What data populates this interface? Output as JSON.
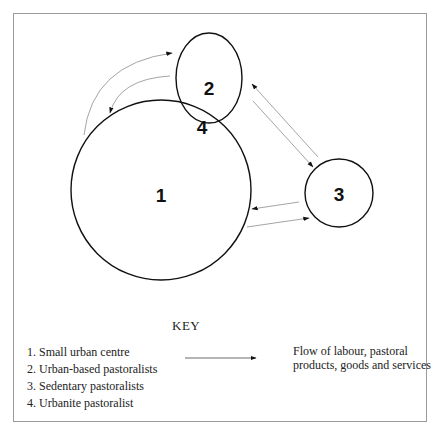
{
  "diagram": {
    "nodes": [
      {
        "id": "1",
        "label": "1",
        "shape": "circle"
      },
      {
        "id": "2",
        "label": "2",
        "shape": "ellipse"
      },
      {
        "id": "3",
        "label": "3",
        "shape": "circle"
      },
      {
        "id": "4",
        "label": "4",
        "shape": "overlap-of-1-and-2"
      }
    ],
    "flows": [
      {
        "from": "1",
        "to": "2",
        "style": "curved"
      },
      {
        "from": "2",
        "to": "1",
        "style": "curved"
      },
      {
        "from": "3",
        "to": "2",
        "style": "straight"
      },
      {
        "from": "2",
        "to": "3",
        "style": "straight"
      },
      {
        "from": "3",
        "to": "1",
        "style": "straight"
      },
      {
        "from": "1",
        "to": "3",
        "style": "straight"
      }
    ]
  },
  "key": {
    "title": "KEY",
    "items": [
      "1. Small urban centre",
      "2. Urban-based pastoralists",
      "3. Sedentary pastoralists",
      "4. Urbanite pastoralist"
    ],
    "arrow_meaning_line1": "Flow of labour, pastoral",
    "arrow_meaning_line2": "products, goods and services"
  },
  "colors": {
    "shape_stroke": "#111111",
    "arrow_stroke": "#9a9a9a",
    "frame": "#9a9a9a"
  }
}
